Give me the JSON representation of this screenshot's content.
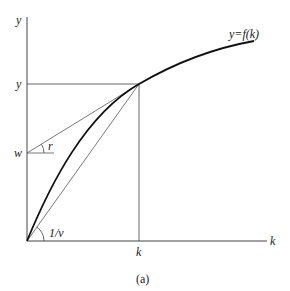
{
  "figure": {
    "caption": "(a)",
    "axes": {
      "y_axis_label": "y",
      "x_axis_label": "k"
    },
    "curve_label": "y=f(k)",
    "point_labels": {
      "y_level": "y",
      "w_level": "w",
      "k_level": "k"
    },
    "angle_labels": {
      "r": "r",
      "inv_v": "1/v"
    },
    "colors": {
      "line": "#333333",
      "curve": "#111111",
      "background": "#ffffff"
    }
  }
}
